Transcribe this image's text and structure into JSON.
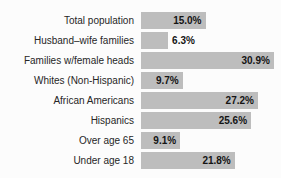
{
  "title_fragment": "Percentage Living in Poverty",
  "colors": {
    "background": "#fcfcfc",
    "bar": "#bdbdbd",
    "label_text": "#262626",
    "value_text": "#141414"
  },
  "chart_data": {
    "type": "bar",
    "orientation": "horizontal",
    "title": "Percentage Living in Poverty",
    "categories": [
      "Total population",
      "Husband–wife families",
      "Families w/female heads",
      "Whites (Non-Hispanic)",
      "African Americans",
      "Hispanics",
      "Over age 65",
      "Under age 18"
    ],
    "values": [
      15.0,
      6.3,
      30.9,
      9.7,
      27.2,
      25.6,
      9.1,
      21.8
    ],
    "value_labels": [
      "15.0%",
      "6.3%",
      "30.9%",
      "9.7%",
      "27.2%",
      "25.6%",
      "9.1%",
      "21.8%"
    ],
    "xlabel": "",
    "ylabel": "",
    "xlim": [
      0,
      31
    ],
    "grid": false,
    "legend": false,
    "value_label_style": "inside-end, outside-end when bar too short"
  }
}
